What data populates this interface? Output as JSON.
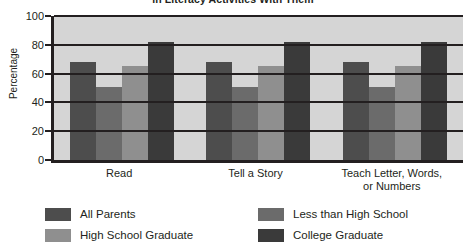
{
  "chart_data": {
    "type": "bar",
    "title": "in Literacy Activities With Them",
    "xlabel": "",
    "ylabel": "Percentage",
    "ylim": [
      0,
      100
    ],
    "yticks": [
      0,
      20,
      40,
      60,
      80,
      100
    ],
    "ytick_labels": [
      "0",
      "20",
      "40",
      "60",
      "80",
      "100"
    ],
    "grid": true,
    "legend_position": "bottom",
    "categories": [
      "Read",
      "Tell a Story",
      "Teach Letter, Words, or Numbers"
    ],
    "category_lines": [
      [
        "Read"
      ],
      [
        "Tell a Story"
      ],
      [
        "Teach Letter, Words,",
        "or Numbers"
      ]
    ],
    "series": [
      {
        "name": "All Parents",
        "color": "#4d4d4d",
        "values": [
          68,
          68,
          68
        ]
      },
      {
        "name": "Less than High School",
        "color": "#6b6b6b",
        "values": [
          51,
          51,
          51
        ]
      },
      {
        "name": "High School Graduate",
        "color": "#8f8f8f",
        "values": [
          65,
          65,
          65
        ]
      },
      {
        "name": "College Graduate",
        "color": "#3a3a3a",
        "values": [
          82,
          82,
          82
        ]
      }
    ]
  },
  "legend": {
    "items": [
      {
        "label": "All Parents",
        "color": "#4d4d4d"
      },
      {
        "label": "Less than High School",
        "color": "#6b6b6b"
      },
      {
        "label": "High School Graduate",
        "color": "#8f8f8f"
      },
      {
        "label": "College Graduate",
        "color": "#3a3a3a"
      }
    ]
  },
  "colors": {
    "plot_background": "#d5d5d5",
    "axis": "#231f20",
    "page_background": "#ffffff"
  }
}
